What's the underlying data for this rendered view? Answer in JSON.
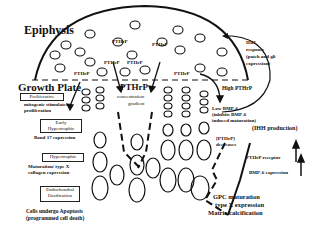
{
  "diagram": {
    "title_epiphysis": "Epiphysis",
    "title_growth_plate": "Growth Plate",
    "pthrp_labels": [
      "PTHrP",
      "PTHrP",
      "PTHrP",
      "PTHrP",
      "PTHrP",
      "PTHrP"
    ],
    "pthrp_center": "PTHrP",
    "concentration": "concentration",
    "gradient": "gradient",
    "zones": {
      "proliferative": "Proliferative",
      "early_hypertrophic_1": "Early",
      "early_hypertrophic_2": "Hypertrophic",
      "hypertrophic": "Hypertrophic",
      "endochondral_1": "Endochondral",
      "endochondral_2": "Ossification"
    },
    "left_notes": {
      "mitogenic_1": "mitogenic stimulates",
      "mitogenic_2": "proliferation",
      "band17": "Band 17 expression",
      "maturation_1": "Maturation/ type X",
      "maturation_2": "collagen expression",
      "apoptosis_1": "Cells undergo Apoptosis",
      "apoptosis_2": "(programmed cell death)"
    },
    "right_notes": {
      "ihh_response_1": "IHH",
      "ihh_response_2": "response",
      "ihh_response_3": "(patch and gli",
      "ihh_response_4": "expression)",
      "high_pthrp": "High PTHrP",
      "low_bmp_1": "Low BMP-6",
      "low_bmp_2": "(inhibits BMP-6",
      "low_bmp_3": "induced maturation)",
      "ihh_production": "(IHH production)",
      "pthrp_decreases_1": "[PTHrP]",
      "pthrp_decreases_2": "decreases",
      "pthrp_receptor": "PTHrP receptor",
      "bmp6_expression": "BMP-6 expression",
      "gpc_1": "GPC maturation",
      "gpc_2": "type X expression",
      "gpc_3": "Matrix calcification"
    }
  }
}
